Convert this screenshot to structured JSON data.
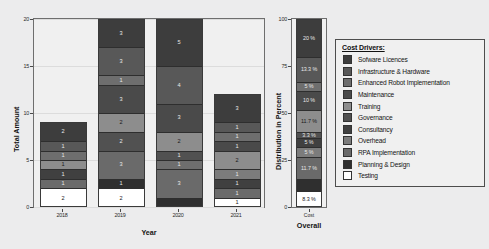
{
  "chart_data": {
    "type": "bar",
    "title": "",
    "subtitle": "",
    "stacked": true,
    "grid": true,
    "panels": [
      {
        "name": "years",
        "xlabel": "Year",
        "ylabel": "Total Amount",
        "ylim": [
          0,
          20
        ],
        "yticks": [
          "0",
          "5",
          "10",
          "15",
          "20"
        ],
        "categories": [
          "2018",
          "2019",
          "2020",
          "2021"
        ],
        "totals": [
          9,
          20,
          19,
          12
        ],
        "series": [
          {
            "name": "Sofware Licences",
            "values": [
              2,
              3,
              5,
              3
            ]
          },
          {
            "name": "Infrastructure & Hardware",
            "values": [
              1,
              3,
              4,
              1
            ]
          },
          {
            "name": "Enhanced Robot Implementation",
            "values": [
              1,
              1,
              1,
              1
            ]
          },
          {
            "name": "Maintenance",
            "values": [
              0,
              3,
              3,
              1
            ]
          },
          {
            "name": "Training",
            "values": [
              1,
              2,
              2,
              2
            ]
          },
          {
            "name": "Governance",
            "values": [
              0,
              0,
              1,
              0
            ]
          },
          {
            "name": "Consultancy",
            "values": [
              1,
              2,
              0,
              1
            ]
          },
          {
            "name": "Overhead",
            "values": [
              0,
              0,
              0,
              1
            ]
          },
          {
            "name": "RPA Implementation",
            "values": [
              1,
              3,
              3,
              1
            ]
          },
          {
            "name": "Planning & Design",
            "values": [
              0,
              1,
              0,
              0
            ]
          },
          {
            "name": "Testing",
            "values": [
              2,
              2,
              0,
              1
            ]
          }
        ]
      },
      {
        "name": "overall",
        "xlabel": "Overall",
        "xsublabel": "Cost",
        "ylabel": "Distribution in Percent",
        "ylim": [
          0,
          100
        ],
        "yticks": [
          "0",
          "25",
          "50",
          "75",
          "100"
        ],
        "categories": [
          "Overall"
        ],
        "series": [
          {
            "name": "Sofware Licences",
            "values": [
              20.0
            ],
            "label": "20 %"
          },
          {
            "name": "Infrastructure & Hardware",
            "values": [
              13.3
            ],
            "label": "13.3 %"
          },
          {
            "name": "Enhanced Robot Implementation",
            "values": [
              5.0
            ],
            "label": "5 %"
          },
          {
            "name": "Maintenance",
            "values": [
              10.0
            ],
            "label": "10 %"
          },
          {
            "name": "Training",
            "values": [
              11.7
            ],
            "label": "11.7 %"
          },
          {
            "name": "Governance",
            "values": [
              3.3
            ],
            "label": "3.3 %"
          },
          {
            "name": "Consultancy",
            "values": [
              5.0
            ],
            "label": "5 %"
          },
          {
            "name": "Overhead",
            "values": [
              5.0
            ],
            "label": "5 %"
          },
          {
            "name": "RPA Implementation",
            "values": [
              11.7
            ],
            "label": "11.7 %"
          },
          {
            "name": "Planning & Design",
            "values": [
              6.7
            ],
            "label": ""
          },
          {
            "name": "Testing",
            "values": [
              8.3
            ],
            "label": "8.3 %"
          }
        ]
      }
    ],
    "legend": {
      "position": "right",
      "title": "Cost Drivers:",
      "entries": [
        {
          "label": "Sofware Licences",
          "color": "#3d3d3d"
        },
        {
          "label": "Infrastructure & Hardware",
          "color": "#585858"
        },
        {
          "label": "Enhanced Robot Implementation",
          "color": "#6e6e6e"
        },
        {
          "label": "Maintenance",
          "color": "#4a4a4a"
        },
        {
          "label": "Training",
          "color": "#8d8d8d"
        },
        {
          "label": "Governance",
          "color": "#515151"
        },
        {
          "label": "Consultancy",
          "color": "#404040"
        },
        {
          "label": "Overhead",
          "color": "#7c7c7c"
        },
        {
          "label": "RPA Implementation",
          "color": "#6a6a6a"
        },
        {
          "label": "Planning & Design",
          "color": "#2f2f2f"
        },
        {
          "label": "Testing",
          "color": "#ffffff"
        }
      ]
    },
    "bar_segments": {
      "2018": [
        {
          "driver": "Sofware Licences",
          "value": 2,
          "label": "2",
          "color": "#3d3d3d"
        },
        {
          "driver": "Infrastructure & Hardware",
          "value": 1,
          "label": "1",
          "color": "#585858"
        },
        {
          "driver": "Enhanced Robot Implementation",
          "value": 1,
          "label": "1",
          "color": "#6e6e6e"
        },
        {
          "driver": "Training",
          "value": 1,
          "label": "1",
          "color": "#8d8d8d"
        },
        {
          "driver": "Consultancy",
          "value": 1,
          "label": "1",
          "color": "#404040"
        },
        {
          "driver": "RPA Implementation",
          "value": 1,
          "label": "1",
          "color": "#6a6a6a"
        },
        {
          "driver": "Testing",
          "value": 2,
          "label": "2",
          "color": "#ffffff"
        }
      ],
      "2019": [
        {
          "driver": "Sofware Licences",
          "value": 3,
          "label": "3",
          "color": "#3d3d3d"
        },
        {
          "driver": "Infrastructure & Hardware",
          "value": 3,
          "label": "3",
          "color": "#585858"
        },
        {
          "driver": "Enhanced Robot Implementation",
          "value": 1,
          "label": "1",
          "color": "#6e6e6e"
        },
        {
          "driver": "Maintenance",
          "value": 3,
          "label": "3",
          "color": "#4a4a4a"
        },
        {
          "driver": "Training",
          "value": 2,
          "label": "2",
          "color": "#8d8d8d"
        },
        {
          "driver": "Consultancy",
          "value": 2,
          "label": "2",
          "color": "#515151"
        },
        {
          "driver": "RPA Implementation",
          "value": 3,
          "label": "3",
          "color": "#6a6a6a"
        },
        {
          "driver": "Planning & Design",
          "value": 1,
          "label": "1",
          "color": "#2f2f2f"
        },
        {
          "driver": "Testing",
          "value": 2,
          "label": "2",
          "color": "#ffffff"
        }
      ],
      "2020": [
        {
          "driver": "Sofware Licences",
          "value": 5,
          "label": "5",
          "color": "#3d3d3d"
        },
        {
          "driver": "Infrastructure & Hardware",
          "value": 4,
          "label": "4",
          "color": "#585858"
        },
        {
          "driver": "Maintenance",
          "value": 3,
          "label": "3",
          "color": "#4a4a4a"
        },
        {
          "driver": "Training",
          "value": 2,
          "label": "2",
          "color": "#8d8d8d"
        },
        {
          "driver": "Governance",
          "value": 1,
          "label": "1",
          "color": "#515151"
        },
        {
          "driver": "Enhanced Robot Implementation",
          "value": 1,
          "label": "1",
          "color": "#6e6e6e"
        },
        {
          "driver": "RPA Implementation",
          "value": 3,
          "label": "3",
          "color": "#6a6a6a"
        },
        {
          "driver": "Planning & Design",
          "value": 1,
          "label": "",
          "color": "#2f2f2f"
        }
      ],
      "2021": [
        {
          "driver": "Sofware Licences",
          "value": 3,
          "label": "3",
          "color": "#3d3d3d"
        },
        {
          "driver": "Infrastructure & Hardware",
          "value": 1,
          "label": "1",
          "color": "#585858"
        },
        {
          "driver": "Enhanced Robot Implementation",
          "value": 1,
          "label": "1",
          "color": "#6e6e6e"
        },
        {
          "driver": "Maintenance",
          "value": 1,
          "label": "1",
          "color": "#4a4a4a"
        },
        {
          "driver": "Training",
          "value": 2,
          "label": "2",
          "color": "#8d8d8d"
        },
        {
          "driver": "Overhead",
          "value": 1,
          "label": "1",
          "color": "#7c7c7c"
        },
        {
          "driver": "Consultancy",
          "value": 1,
          "label": "1",
          "color": "#404040"
        },
        {
          "driver": "RPA Implementation",
          "value": 1,
          "label": "1",
          "color": "#6a6a6a"
        },
        {
          "driver": "Testing",
          "value": 1,
          "label": "1",
          "color": "#ffffff"
        }
      ],
      "overall": [
        {
          "driver": "Sofware Licences",
          "value": 20.0,
          "label": "20 %",
          "color": "#3d3d3d"
        },
        {
          "driver": "Infrastructure & Hardware",
          "value": 13.3,
          "label": "13.3 %",
          "color": "#585858"
        },
        {
          "driver": "Enhanced Robot Implementation",
          "value": 5.0,
          "label": "5 %",
          "color": "#6e6e6e"
        },
        {
          "driver": "Maintenance",
          "value": 10.0,
          "label": "10 %",
          "color": "#4a4a4a"
        },
        {
          "driver": "Training",
          "value": 11.7,
          "label": "11.7 %",
          "color": "#8d8d8d"
        },
        {
          "driver": "Governance",
          "value": 3.3,
          "label": "3.3 %",
          "color": "#515151"
        },
        {
          "driver": "Consultancy",
          "value": 5.0,
          "label": "5 %",
          "color": "#404040"
        },
        {
          "driver": "Overhead",
          "value": 5.0,
          "label": "5 %",
          "color": "#7c7c7c"
        },
        {
          "driver": "RPA Implementation",
          "value": 11.7,
          "label": "11.7 %",
          "color": "#6a6a6a"
        },
        {
          "driver": "Planning & Design",
          "value": 6.7,
          "label": "",
          "color": "#2f2f2f"
        },
        {
          "driver": "Testing",
          "value": 8.3,
          "label": "8.3 %",
          "color": "#ffffff"
        }
      ]
    }
  }
}
